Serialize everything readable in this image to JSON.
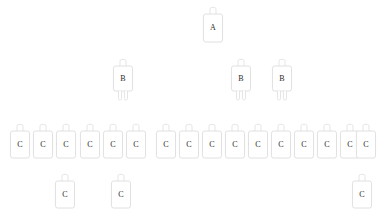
{
  "diagram": {
    "background_color": "#ffffff",
    "node_outline_color": "#dcdcdc",
    "node_fill_color": "#ffffff",
    "label_color": "#2b2b2b",
    "node_shape": "rounded-rectangle-with-top-tab",
    "levels": [
      {
        "level": 1,
        "label_letter": "A",
        "count": 1,
        "has_bottom_legs": false
      },
      {
        "level": 2,
        "label_letter": "B",
        "count": 3,
        "has_bottom_legs": true
      },
      {
        "level": 3,
        "label_letter": "C",
        "count": 16,
        "has_bottom_legs": false
      },
      {
        "level": 4,
        "label_letter": "C",
        "count": 3,
        "has_bottom_legs": false
      }
    ],
    "nodes": [
      {
        "id": "a1",
        "label": "A",
        "x": 203,
        "y": 14,
        "w": 20,
        "h": 28,
        "tab": true,
        "legs": false
      },
      {
        "id": "b1",
        "label": "B",
        "x": 113,
        "y": 66,
        "w": 20,
        "h": 25,
        "tab": true,
        "legs": true
      },
      {
        "id": "b2",
        "label": "B",
        "x": 231,
        "y": 66,
        "w": 20,
        "h": 25,
        "tab": true,
        "legs": true
      },
      {
        "id": "b3",
        "label": "B",
        "x": 272,
        "y": 66,
        "w": 20,
        "h": 25,
        "tab": true,
        "legs": true
      },
      {
        "id": "c1",
        "label": "C",
        "x": 10,
        "y": 131,
        "w": 20,
        "h": 27,
        "tab": true,
        "legs": false
      },
      {
        "id": "c2",
        "label": "C",
        "x": 33,
        "y": 131,
        "w": 20,
        "h": 27,
        "tab": true,
        "legs": false
      },
      {
        "id": "c3",
        "label": "C",
        "x": 56,
        "y": 131,
        "w": 20,
        "h": 27,
        "tab": true,
        "legs": false
      },
      {
        "id": "c4",
        "label": "C",
        "x": 80,
        "y": 131,
        "w": 20,
        "h": 27,
        "tab": true,
        "legs": false
      },
      {
        "id": "c5",
        "label": "C",
        "x": 103,
        "y": 131,
        "w": 20,
        "h": 27,
        "tab": true,
        "legs": false
      },
      {
        "id": "c6",
        "label": "C",
        "x": 126,
        "y": 131,
        "w": 20,
        "h": 27,
        "tab": true,
        "legs": false
      },
      {
        "id": "c7",
        "label": "C",
        "x": 156,
        "y": 131,
        "w": 20,
        "h": 27,
        "tab": true,
        "legs": false
      },
      {
        "id": "c8",
        "label": "C",
        "x": 179,
        "y": 131,
        "w": 20,
        "h": 27,
        "tab": true,
        "legs": false
      },
      {
        "id": "c9",
        "label": "C",
        "x": 202,
        "y": 131,
        "w": 20,
        "h": 27,
        "tab": true,
        "legs": false
      },
      {
        "id": "c10",
        "label": "C",
        "x": 225,
        "y": 131,
        "w": 20,
        "h": 27,
        "tab": true,
        "legs": false
      },
      {
        "id": "c11",
        "label": "C",
        "x": 248,
        "y": 131,
        "w": 20,
        "h": 27,
        "tab": true,
        "legs": false
      },
      {
        "id": "c12",
        "label": "C",
        "x": 271,
        "y": 131,
        "w": 20,
        "h": 27,
        "tab": true,
        "legs": false
      },
      {
        "id": "c13",
        "label": "C",
        "x": 294,
        "y": 131,
        "w": 20,
        "h": 27,
        "tab": true,
        "legs": false
      },
      {
        "id": "c14",
        "label": "C",
        "x": 317,
        "y": 131,
        "w": 20,
        "h": 27,
        "tab": true,
        "legs": false
      },
      {
        "id": "c15",
        "label": "C",
        "x": 340,
        "y": 131,
        "w": 20,
        "h": 27,
        "tab": true,
        "legs": false
      },
      {
        "id": "c16",
        "label": "C",
        "x": 356,
        "y": 131,
        "w": 20,
        "h": 27,
        "tab": true,
        "legs": false
      },
      {
        "id": "c17",
        "label": "C",
        "x": 55,
        "y": 181,
        "w": 20,
        "h": 27,
        "tab": true,
        "legs": false
      },
      {
        "id": "c18",
        "label": "C",
        "x": 111,
        "y": 181,
        "w": 20,
        "h": 27,
        "tab": true,
        "legs": false
      },
      {
        "id": "c19",
        "label": "C",
        "x": 352,
        "y": 181,
        "w": 20,
        "h": 27,
        "tab": true,
        "legs": false
      }
    ]
  }
}
